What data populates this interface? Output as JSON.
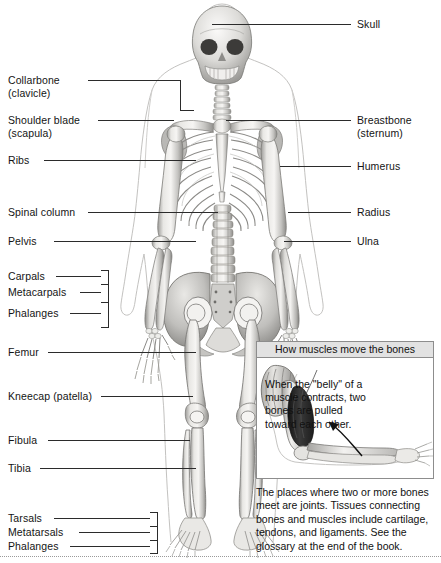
{
  "labels_left": [
    {
      "id": "collarbone",
      "line1": "Collarbone",
      "line2": "(clavicle)"
    },
    {
      "id": "shoulder-blade",
      "line1": "Shoulder blade",
      "line2": "(scapula)"
    },
    {
      "id": "ribs",
      "line1": "Ribs",
      "line2": ""
    },
    {
      "id": "spinal-column",
      "line1": "Spinal column",
      "line2": ""
    },
    {
      "id": "pelvis",
      "line1": "Pelvis",
      "line2": ""
    },
    {
      "id": "carpals",
      "line1": "Carpals",
      "line2": ""
    },
    {
      "id": "metacarpals",
      "line1": "Metacarpals",
      "line2": ""
    },
    {
      "id": "phalanges-hand",
      "line1": "Phalanges",
      "line2": ""
    },
    {
      "id": "femur",
      "line1": "Femur",
      "line2": ""
    },
    {
      "id": "kneecap",
      "line1": "Kneecap (patella)",
      "line2": ""
    },
    {
      "id": "fibula",
      "line1": "Fibula",
      "line2": ""
    },
    {
      "id": "tibia",
      "line1": "Tibia",
      "line2": ""
    },
    {
      "id": "tarsals",
      "line1": "Tarsals",
      "line2": ""
    },
    {
      "id": "metatarsals",
      "line1": "Metatarsals",
      "line2": ""
    },
    {
      "id": "phalanges-foot",
      "line1": "Phalanges",
      "line2": ""
    }
  ],
  "labels_right": [
    {
      "id": "skull",
      "line1": "Skull",
      "line2": ""
    },
    {
      "id": "breastbone",
      "line1": "Breastbone",
      "line2": "(sternum)"
    },
    {
      "id": "humerus",
      "line1": "Humerus",
      "line2": ""
    },
    {
      "id": "radius",
      "line1": "Radius",
      "line2": ""
    },
    {
      "id": "ulna",
      "line1": "Ulna",
      "line2": ""
    }
  ],
  "inset": {
    "title": "How muscles move the bones",
    "caption": "When the \"belly\" of a muscle contracts, two bones are pulled toward each other."
  },
  "bottom_note": "The places where two or more bones meet are joints. Tissues connecting bones and muscles include cartilage, tendons, and ligaments. See the glossary at the end of the book.",
  "colors": {
    "bone_light": "#f2f1ef",
    "bone_mid": "#c9c8c5",
    "bone_dark": "#8e8d8a",
    "outline": "#6e6d6b",
    "body_outline": "#b9b8b6",
    "leader": "#2b2b2b",
    "panel_header": "#e2e2e2",
    "panel_border": "#8d8d8d",
    "muscle_dark": "#2f2f2f",
    "text": "#141414"
  }
}
